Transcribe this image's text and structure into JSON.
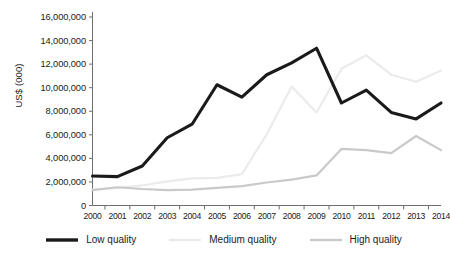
{
  "chart_data": {
    "type": "line",
    "title": "",
    "xlabel": "",
    "ylabel": "US$ (000)",
    "categories": [
      "2000",
      "2001",
      "2002",
      "2003",
      "2004",
      "2005",
      "2006",
      "2007",
      "2008",
      "2009",
      "2010",
      "2011",
      "2012",
      "2013",
      "2014"
    ],
    "ylim": [
      0,
      16000000
    ],
    "ytick_values": [
      0,
      2000000,
      4000000,
      6000000,
      8000000,
      10000000,
      12000000,
      14000000,
      16000000
    ],
    "ytick_labels": [
      "0",
      "2,000,000",
      "4,000,000",
      "6,000,000",
      "8,000,000",
      "10,000,000",
      "12,000,000",
      "14,000,000",
      "16,000,000"
    ],
    "grid": false,
    "legend_position": "bottom",
    "series": [
      {
        "name": "Low quality",
        "color": "#1a1a1a",
        "width": 3.1,
        "values": [
          2500000,
          2450000,
          3350000,
          5750000,
          6900000,
          10250000,
          9200000,
          11100000,
          12100000,
          13350000,
          8700000,
          9800000,
          7900000,
          7350000,
          8700000
        ]
      },
      {
        "name": "Medium quality",
        "color": "#ebebeb",
        "width": 2.2,
        "values": [
          1350000,
          1500000,
          1700000,
          2050000,
          2300000,
          2350000,
          2650000,
          6050000,
          10100000,
          7900000,
          11600000,
          12750000,
          11100000,
          10500000,
          11450000
        ]
      },
      {
        "name": "High quality",
        "color": "#c9c9c9",
        "width": 2.2,
        "values": [
          1300000,
          1550000,
          1400000,
          1300000,
          1350000,
          1500000,
          1650000,
          1950000,
          2200000,
          2550000,
          4800000,
          4700000,
          4450000,
          5900000,
          4700000
        ]
      }
    ]
  },
  "axes": {
    "axis_color": "#6e6e6e",
    "tick_color": "#6e6e6e"
  },
  "legend": {
    "items": [
      {
        "label": "Low quality"
      },
      {
        "label": "Medium quality"
      },
      {
        "label": "High quality"
      }
    ]
  }
}
